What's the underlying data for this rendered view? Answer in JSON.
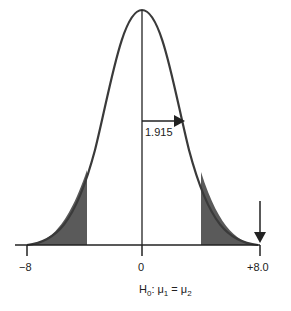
{
  "diagram": {
    "type": "normal-distribution-two-tailed",
    "critical_value_label": "1.915",
    "x_ticks": [
      {
        "label": "−8",
        "value": -8
      },
      {
        "label": "0",
        "value": 0
      },
      {
        "label": "+8.0",
        "value": 8
      }
    ],
    "caption": {
      "h": "H",
      "sub0": "0",
      "mid": ": μ",
      "sub1": "1",
      "eq": " = μ",
      "sub2": "2"
    },
    "colors": {
      "curve": "#3a3a3a",
      "shade": "#5a5a5a",
      "axis": "#222222"
    }
  }
}
